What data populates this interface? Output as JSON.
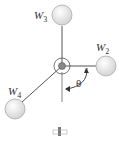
{
  "diagram": {
    "type": "rotating weights on shaft",
    "labels": {
      "w3": {
        "main": "W",
        "sub": "3"
      },
      "w2": {
        "main": "W",
        "sub": "2"
      },
      "w4": {
        "main": "W",
        "sub": "4"
      },
      "theta": "θ"
    },
    "colors": {
      "ball_fill": "#e6e6e6",
      "ball_stroke": "#a0a0a0",
      "rod": "#555555",
      "hub": "#8a8a8a"
    }
  }
}
